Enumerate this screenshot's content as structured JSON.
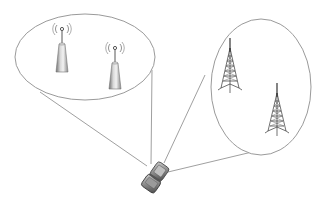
{
  "diagram": {
    "title": "",
    "background": "#ffffff",
    "stroke_color": "#9a9a9a",
    "groups": [
      {
        "id": "small-cells",
        "shape": "ellipse",
        "label": "",
        "items": [
          {
            "type": "small-cell-antenna",
            "label": ""
          },
          {
            "type": "small-cell-antenna",
            "label": ""
          }
        ]
      },
      {
        "id": "macro-towers",
        "shape": "ellipse",
        "label": "",
        "items": [
          {
            "type": "lattice-cell-tower",
            "label": ""
          },
          {
            "type": "lattice-cell-tower",
            "label": ""
          }
        ]
      }
    ],
    "device": {
      "type": "mobile-flip-phone",
      "label": ""
    },
    "connections": [
      {
        "from": "small-cells",
        "to": "device"
      },
      {
        "from": "small-cells",
        "to": "device"
      },
      {
        "from": "macro-towers",
        "to": "device"
      },
      {
        "from": "macro-towers",
        "to": "device"
      }
    ]
  }
}
